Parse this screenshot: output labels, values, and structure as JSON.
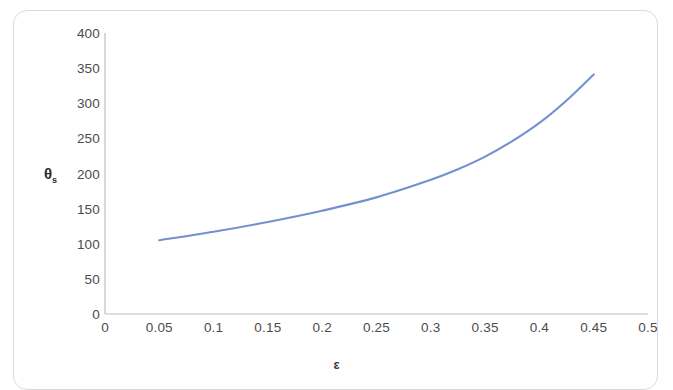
{
  "figure": {
    "background_color": "#ffffff",
    "frame_color": "#d8dade",
    "tick_label_color": "#4c4c4c",
    "axis_line_color": "#bfbfbf",
    "series_color": "#7590d0"
  },
  "axis_titles": {
    "y": "θ",
    "y_subscript": "s",
    "x": "ε"
  },
  "chart_data": {
    "type": "line",
    "title": "",
    "subtitle": "",
    "xlabel": "ε",
    "ylabel": "θs",
    "xlim": [
      0,
      0.5
    ],
    "ylim": [
      0,
      400
    ],
    "xticks": [
      0,
      0.05,
      0.1,
      0.15,
      0.2,
      0.25,
      0.3,
      0.35,
      0.4,
      0.45,
      0.5
    ],
    "xtick_labels": [
      "0",
      "0.05",
      "0.1",
      "0.15",
      "0.2",
      "0.25",
      "0.3",
      "0.35",
      "0.4",
      "0.45",
      "0.5"
    ],
    "yticks": [
      0,
      50,
      100,
      150,
      200,
      250,
      300,
      350,
      400
    ],
    "ytick_labels": [
      "0",
      "50",
      "100",
      "150",
      "200",
      "250",
      "300",
      "350",
      "400"
    ],
    "grid": false,
    "legend": false,
    "legend_position": "none",
    "series": [
      {
        "name": "θs vs ε",
        "color": "#7590d0",
        "line_width": 2,
        "markers": false,
        "x": [
          0.05,
          0.1,
          0.15,
          0.2,
          0.25,
          0.3,
          0.325,
          0.35,
          0.375,
          0.4,
          0.425,
          0.45
        ],
        "y": [
          105,
          117,
          131,
          147,
          166,
          191,
          206,
          224,
          246,
          272,
          304,
          341
        ]
      }
    ]
  }
}
